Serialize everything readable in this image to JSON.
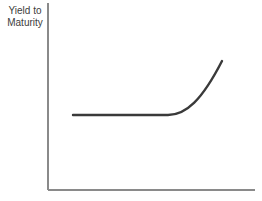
{
  "figure": {
    "background_color": "#ffffff",
    "width": 262,
    "height": 201
  },
  "axes": {
    "y_axis_label": "Yield to\nMaturity",
    "y_axis_label_line1": "Yield to",
    "y_axis_label_line2": "Maturity",
    "x_axis_label": "",
    "axis_color": "#8a8a8a",
    "axis_width": 1.4,
    "origin_x": 48,
    "origin_y": 190,
    "y_axis_top": 3,
    "x_axis_right": 255
  },
  "curve": {
    "name": "yield-curve",
    "color": "#3a3a3a",
    "stroke_width": 2.4,
    "shape": "normal-upward-sloping",
    "path": "M 73 115 L 168 115 C 186 115 202 100 222 61"
  },
  "chart_data": {
    "type": "line",
    "title": "",
    "xlabel": "",
    "ylabel": "Yield to Maturity",
    "grid": false,
    "legend": "none",
    "xlim": [
      0,
      100
    ],
    "ylim": [
      0,
      100
    ],
    "series": [
      {
        "name": "Yield Curve",
        "x": [
          12,
          25,
          40,
          55,
          58,
          65,
          72,
          78,
          84,
          90,
          95,
          100
        ],
        "y": [
          40,
          40,
          40,
          40,
          40,
          41,
          45,
          52,
          60,
          68,
          75,
          81
        ]
      }
    ],
    "annotations": [
      {
        "text": "Yield to Maturity",
        "role": "y-axis-title",
        "position": "top-left"
      }
    ]
  }
}
